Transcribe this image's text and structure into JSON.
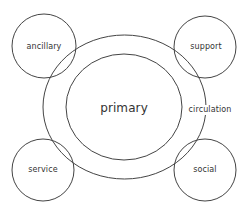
{
  "diagram": {
    "type": "bubble-diagram",
    "stroke_color": "#444444",
    "text_color": "#333333",
    "background": "#ffffff",
    "zones": [
      {
        "id": "primary",
        "label": "primary",
        "shape": "ellipse",
        "cx": 124,
        "cy": 107,
        "rx": 58,
        "ry": 53
      },
      {
        "id": "circulation",
        "label": "circulation",
        "shape": "ellipse",
        "cx": 124.5,
        "cy": 107,
        "rx": 81.5,
        "ry": 72
      }
    ],
    "satellites": [
      {
        "id": "ancillary",
        "label": "ancillary",
        "cx": 44,
        "cy": 46,
        "r": 32
      },
      {
        "id": "support",
        "label": "support",
        "cx": 205,
        "cy": 47,
        "r": 31
      },
      {
        "id": "service",
        "label": "service",
        "cx": 43,
        "cy": 170,
        "r": 31
      },
      {
        "id": "social",
        "label": "social",
        "cx": 205,
        "cy": 170,
        "r": 31
      }
    ]
  },
  "labels": {
    "primary": "primary",
    "circulation": "circulation",
    "ancillary": "ancillary",
    "support": "support",
    "service": "service",
    "social": "social"
  }
}
